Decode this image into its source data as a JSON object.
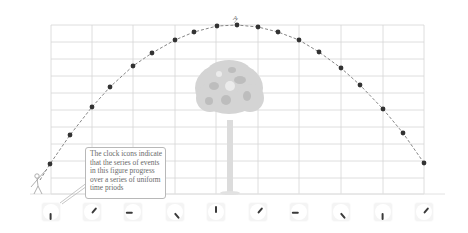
{
  "figure": {
    "peak_label": "A",
    "callout_text": [
      "The clock icons indicate",
      "that the series of events",
      "in this figure progress",
      "over a series of uniform",
      "time priods"
    ],
    "colors": {
      "grid": "#d6d6d6",
      "trajectory": "#777777",
      "dot": "#333333",
      "tree": "#d2d2d2",
      "text": "#6a6a6a"
    }
  },
  "grid": {
    "vertical_x": [
      51,
      92,
      133,
      175,
      216,
      258,
      299,
      341,
      383,
      424
    ],
    "horizontal_y": [
      25,
      42,
      59,
      76,
      93,
      110,
      127,
      144,
      161,
      178,
      194
    ],
    "left": 51,
    "right": 424,
    "top": 25,
    "bottom": 194
  },
  "trajectory": {
    "points": [
      [
        50,
        164
      ],
      [
        70,
        135
      ],
      [
        92,
        107
      ],
      [
        110,
        87
      ],
      [
        133,
        66
      ],
      [
        152,
        53
      ],
      [
        175,
        40
      ],
      [
        194,
        32
      ],
      [
        217,
        26
      ],
      [
        237,
        25
      ],
      [
        258,
        27
      ],
      [
        278,
        32
      ],
      [
        299,
        40
      ],
      [
        319,
        52
      ],
      [
        341,
        68
      ],
      [
        360,
        85
      ],
      [
        383,
        109
      ],
      [
        403,
        133
      ],
      [
        424,
        163
      ]
    ]
  },
  "clocks": [
    {
      "x": 51,
      "angle": 180
    },
    {
      "x": 92,
      "angle": 40
    },
    {
      "x": 133,
      "angle": 270
    },
    {
      "x": 175,
      "angle": 140
    },
    {
      "x": 216,
      "angle": 0
    },
    {
      "x": 258,
      "angle": 40
    },
    {
      "x": 299,
      "angle": 270
    },
    {
      "x": 341,
      "angle": 140
    },
    {
      "x": 383,
      "angle": 180
    },
    {
      "x": 424,
      "angle": 40
    }
  ],
  "chart_data": {
    "type": "scatter",
    "title": "",
    "xlabel": "",
    "ylabel": "",
    "annotations": [
      "A",
      "The clock icons indicate that the series of events in this figure progress over a series of uniform time priods"
    ],
    "grid": true,
    "series": [
      {
        "name": "projectile positions at uniform time intervals",
        "x": [
          50,
          70,
          92,
          110,
          133,
          152,
          175,
          194,
          217,
          237,
          258,
          278,
          299,
          319,
          341,
          360,
          383,
          403,
          424
        ],
        "y": [
          164,
          135,
          107,
          87,
          66,
          53,
          40,
          32,
          26,
          25,
          27,
          32,
          40,
          52,
          68,
          85,
          109,
          133,
          163
        ]
      }
    ]
  }
}
